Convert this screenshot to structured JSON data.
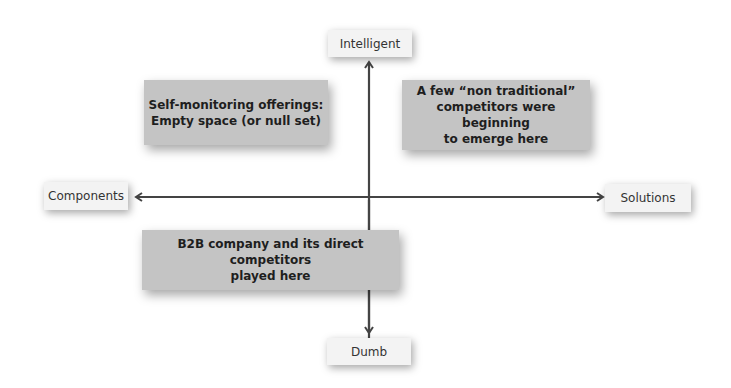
{
  "diagram": {
    "type": "2x2 positioning map",
    "axes": {
      "vertical": {
        "top": "Intelligent",
        "bottom": "Dumb"
      },
      "horizontal": {
        "left": "Components",
        "right": "Solutions"
      }
    },
    "quadrants": {
      "top_left": {
        "line1": "Self-monitoring offerings:",
        "line2": "Empty space (or null set)"
      },
      "top_right": {
        "line1": "A few “non traditional”",
        "line2": "competitors were beginning",
        "line3": "to emerge here"
      },
      "bottom_center": {
        "line1": "B2B company and its direct competitors",
        "line2": "played here"
      }
    },
    "colors": {
      "axis_line": "#444444",
      "quadrant_box": "#c4c4c4",
      "label_box": "#f3f3f3"
    }
  }
}
